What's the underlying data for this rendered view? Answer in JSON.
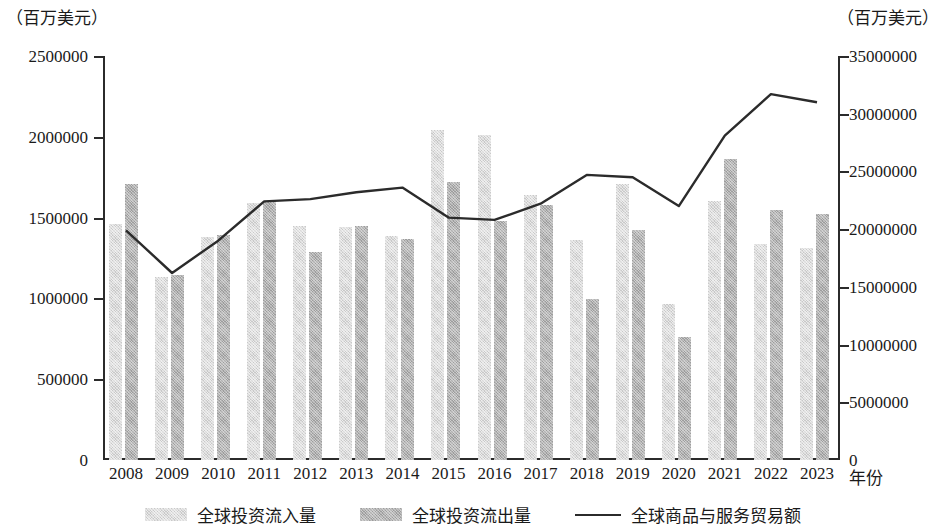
{
  "axis_unit_left": "（百万美元）",
  "axis_unit_right": "（百万美元）",
  "xaxis_title": "年份",
  "zero_right": "0",
  "legend": {
    "inflow": "全球投资流入量",
    "outflow": "全球投资流出量",
    "trade": "全球商品与服务贸易额"
  },
  "colors": {
    "inflow": "#c9c9c9",
    "outflow": "#9d9d9d",
    "trade_line": "#2b2b2b",
    "axis": "#2b2b2b"
  },
  "left_ticks": [
    "0",
    "500000",
    "1000000",
    "1500000",
    "2000000",
    "2500000"
  ],
  "right_ticks": [
    "0",
    "5000000",
    "10000000",
    "15000000",
    "20000000",
    "25000000",
    "30000000",
    "35000000"
  ],
  "chart_data": {
    "type": "bar",
    "title": "",
    "xlabel": "年份",
    "ylabel": "（百万美元）",
    "y2label": "（百万美元）",
    "ylim": [
      0,
      2500000
    ],
    "y2lim": [
      0,
      35000000
    ],
    "grid": false,
    "legend_position": "bottom",
    "categories": [
      "2008",
      "2009",
      "2010",
      "2011",
      "2012",
      "2013",
      "2014",
      "2015",
      "2016",
      "2017",
      "2018",
      "2019",
      "2020",
      "2021",
      "2022",
      "2023"
    ],
    "series": [
      {
        "name": "全球投资流入量",
        "type": "bar",
        "axis": "left",
        "color": "#c9c9c9",
        "values": [
          1460000,
          1130000,
          1380000,
          1590000,
          1450000,
          1445000,
          1385000,
          2040000,
          2010000,
          1640000,
          1360000,
          1710000,
          965000,
          1600000,
          1335000,
          1310000
        ]
      },
      {
        "name": "全球投资流出量",
        "type": "bar",
        "axis": "left",
        "color": "#9d9d9d",
        "values": [
          1710000,
          1145000,
          1395000,
          1600000,
          1285000,
          1450000,
          1370000,
          1720000,
          1480000,
          1575000,
          995000,
          1425000,
          760000,
          1860000,
          1545000,
          1525000
        ]
      },
      {
        "name": "全球商品与服务贸易额",
        "type": "line",
        "axis": "right",
        "color": "#2b2b2b",
        "values": [
          19900000,
          16200000,
          19000000,
          22400000,
          22600000,
          23200000,
          23600000,
          21000000,
          20800000,
          22200000,
          24700000,
          24500000,
          22000000,
          28100000,
          31700000,
          31000000
        ]
      }
    ]
  }
}
